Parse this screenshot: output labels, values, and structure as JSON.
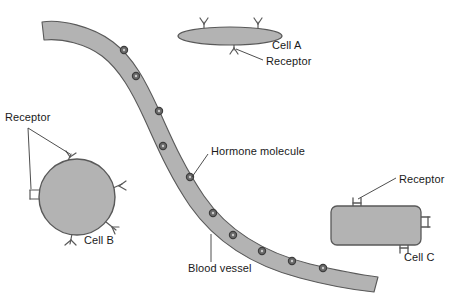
{
  "diagram": {
    "background_color": "#ffffff",
    "fill_color": "#b3b3b3",
    "stroke_color": "#595959",
    "molecule_color": "#4d4d4d",
    "text_color": "#1a1a1a",
    "leader_color": "#3a3a3a"
  },
  "labels": {
    "cell_a": "Cell A",
    "cell_b": "Cell B",
    "cell_c": "Cell C",
    "receptor_a": "Receptor",
    "receptor_b": "Receptor",
    "receptor_c": "Receptor",
    "hormone_molecule": "Hormone molecule",
    "blood_vessel": "Blood vessel"
  },
  "structures": {
    "cell_a": {
      "shape": "ellipse",
      "cx": 230,
      "cy": 36,
      "rx": 52,
      "ry": 9,
      "receptors": [
        {
          "x": 204,
          "y": 27,
          "dir": "up"
        },
        {
          "x": 258,
          "y": 27,
          "dir": "up"
        },
        {
          "x": 234,
          "y": 45,
          "dir": "down"
        }
      ],
      "receptor_count": 3
    },
    "cell_b": {
      "shape": "circle",
      "cx": 77,
      "cy": 197,
      "r": 38,
      "receptors": [
        {
          "angle": -70,
          "style": "y"
        },
        {
          "angle": 180,
          "style": "u"
        },
        {
          "angle": 10,
          "style": "y"
        },
        {
          "angle": 50,
          "style": "y"
        },
        {
          "angle": 100,
          "style": "y"
        }
      ],
      "receptor_count": 5
    },
    "cell_c": {
      "shape": "rounded-rect",
      "x": 331,
      "y": 206,
      "width": 90,
      "height": 39,
      "radius": 6,
      "receptors": [
        {
          "side": "top",
          "x": 357
        },
        {
          "side": "right",
          "y": 222
        },
        {
          "side": "bottom",
          "x": 404
        }
      ],
      "receptor_count": 3
    },
    "blood_vessel": {
      "shape": "curved-band",
      "description": "S-curved band from upper-left to lower-right",
      "start": {
        "x": 42,
        "y": 22
      },
      "end": {
        "x": 378,
        "y": 278
      },
      "band_width": 22
    },
    "hormone_molecules": {
      "count": 10,
      "radius": 3.4,
      "positions": [
        {
          "x": 124,
          "y": 50
        },
        {
          "x": 136,
          "y": 76
        },
        {
          "x": 159,
          "y": 111
        },
        {
          "x": 163,
          "y": 146
        },
        {
          "x": 190,
          "y": 177
        },
        {
          "x": 213,
          "y": 213
        },
        {
          "x": 233,
          "y": 235
        },
        {
          "x": 262,
          "y": 251
        },
        {
          "x": 292,
          "y": 261
        },
        {
          "x": 323,
          "y": 268
        }
      ]
    }
  },
  "label_positions": {
    "cell_a": {
      "x": 272,
      "y": 46
    },
    "receptor_a": {
      "x": 266,
      "y": 62
    },
    "receptor_b": {
      "x": 5,
      "y": 118
    },
    "cell_b": {
      "x": 84,
      "y": 240
    },
    "hormone_molecule": {
      "x": 211,
      "y": 151
    },
    "blood_vessel": {
      "x": 188,
      "y": 268
    },
    "receptor_c": {
      "x": 399,
      "y": 179
    },
    "cell_c": {
      "x": 404,
      "y": 256
    }
  }
}
